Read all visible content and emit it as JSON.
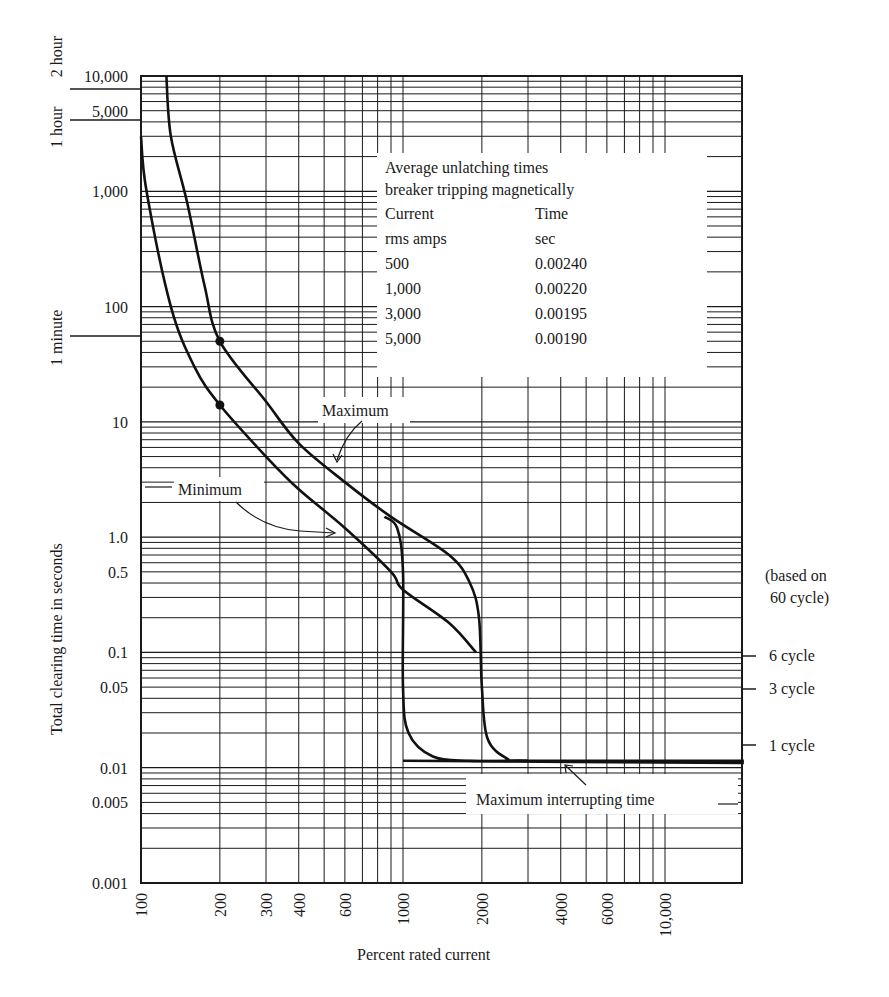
{
  "chart_data": {
    "type": "line",
    "title": "",
    "xlabel": "Percent rated current",
    "ylabel": "Total clearing time in seconds",
    "x_scale": "log",
    "y_scale": "log",
    "xlim": [
      100,
      20000
    ],
    "ylim": [
      0.001,
      10000
    ],
    "grid": true,
    "x_ticks": [
      "100",
      "200",
      "300",
      "400",
      "600",
      "1000",
      "2000",
      "4000",
      "6000",
      "10,000"
    ],
    "y_ticks": [
      "10,000",
      "5,000",
      "1,000",
      "100",
      "10",
      "1.0",
      "0.5",
      "0.1",
      "0.05",
      "0.01",
      "0.005",
      "0.001"
    ],
    "left_time_markers": [
      "2 hour",
      "1 hour",
      "1 minute"
    ],
    "right_cycle_markers": {
      "header": [
        "(based on",
        "60 cycle)"
      ],
      "items": [
        "6 cycle",
        "3 cycle",
        "1 cycle"
      ]
    },
    "series": [
      {
        "name": "Maximum",
        "points": [
          [
            125,
            10000
          ],
          [
            130,
            3000
          ],
          [
            150,
            800
          ],
          [
            175,
            150
          ],
          [
            200,
            50
          ],
          [
            300,
            15
          ],
          [
            400,
            6.5
          ],
          [
            600,
            3
          ],
          [
            900,
            1.5
          ],
          [
            1500,
            0.7
          ],
          [
            1800,
            0.4
          ],
          [
            1950,
            0.2
          ],
          [
            2000,
            0.05
          ],
          [
            2100,
            0.018
          ],
          [
            2500,
            0.012
          ],
          [
            3000,
            0.0115
          ],
          [
            20000,
            0.0115
          ]
        ]
      },
      {
        "name": "Minimum",
        "points": [
          [
            100,
            3000
          ],
          [
            105,
            1000
          ],
          [
            130,
            100
          ],
          [
            160,
            30
          ],
          [
            200,
            14
          ],
          [
            300,
            5
          ],
          [
            400,
            2.6
          ],
          [
            600,
            1.2
          ],
          [
            900,
            0.5
          ],
          [
            1000,
            0.35
          ],
          [
            1500,
            0.18
          ],
          [
            1900,
            0.1
          ]
        ]
      },
      {
        "name": "Minimum (magnetic trip at 1000%)",
        "points": [
          [
            850,
            1.5
          ],
          [
            950,
            1.2
          ],
          [
            1000,
            0.5
          ],
          [
            1000,
            0.05
          ],
          [
            1050,
            0.02
          ],
          [
            1300,
            0.0125
          ],
          [
            1800,
            0.0115
          ],
          [
            3000,
            0.0115
          ]
        ]
      },
      {
        "name": "Maximum interrupting time",
        "points": [
          [
            1000,
            0.0115
          ],
          [
            20000,
            0.011
          ]
        ]
      }
    ],
    "markers": [
      {
        "series": "Maximum",
        "x": 200,
        "y": 50
      },
      {
        "series": "Minimum",
        "x": 200,
        "y": 14
      }
    ],
    "annotations": [
      "Maximum",
      "Minimum",
      "Maximum interrupting time"
    ]
  },
  "info_box": {
    "title_lines": [
      "Average unlatching times",
      "breaker tripping magnetically"
    ],
    "headers": [
      [
        "Current",
        "Time"
      ],
      [
        "rms amps",
        "sec"
      ]
    ],
    "rows": [
      [
        "500",
        "0.00240"
      ],
      [
        "1,000",
        "0.00220"
      ],
      [
        "3,000",
        "0.00195"
      ],
      [
        "5,000",
        "0.00190"
      ]
    ]
  },
  "labels": {
    "maximum": "Maximum",
    "minimum": "Minimum",
    "max_interrupt": "Maximum interrupting time",
    "x_axis_title": "Percent rated current",
    "y_axis_title": "Total clearing time in seconds",
    "based_on_1": "(based on",
    "based_on_2": "60 cycle)",
    "cycle_6": "6 cycle",
    "cycle_3": "3 cycle",
    "cycle_1": "1 cycle",
    "hour_2": "2 hour",
    "hour_1": "1 hour",
    "minute_1": "1 minute"
  }
}
